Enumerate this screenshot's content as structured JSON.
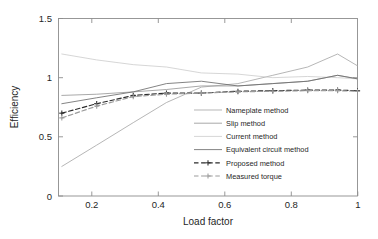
{
  "chart_data": {
    "type": "line",
    "title": "",
    "xlabel": "Load factor",
    "ylabel": "Efficiency",
    "xlim": [
      0.1,
      1.0
    ],
    "ylim": [
      0,
      1.5
    ],
    "xticks": [
      "0.2",
      "0.4",
      "0.6",
      "0.8",
      "1"
    ],
    "xtick_values": [
      0.2,
      0.4,
      0.6,
      0.8,
      1.0
    ],
    "yticks": [
      "0",
      "0.5",
      "1",
      "1.5"
    ],
    "ytick_values": [
      0,
      0.5,
      1.0,
      1.5
    ],
    "grid": false,
    "legend_position": "center-right-inside",
    "x": [
      0.11,
      0.215,
      0.325,
      0.425,
      0.53,
      0.64,
      0.745,
      0.85,
      0.94,
      1.0
    ],
    "series": [
      {
        "name": "Nameplate method",
        "color": "#a9a9a9",
        "style": "solid",
        "marker": "none",
        "values": [
          0.25,
          0.43,
          0.62,
          0.79,
          0.92,
          0.95,
          1.02,
          1.09,
          1.2,
          1.1
        ]
      },
      {
        "name": "Slip method",
        "color": "#9a9a9a",
        "style": "solid",
        "marker": "none",
        "values": [
          0.85,
          0.86,
          0.88,
          0.9,
          0.93,
          0.93,
          0.95,
          0.97,
          1.02,
          0.99
        ]
      },
      {
        "name": "Current method",
        "color": "#cfcfcf",
        "style": "solid",
        "marker": "none",
        "values": [
          1.2,
          1.15,
          1.11,
          1.09,
          1.04,
          1.03,
          1.0,
          1.01,
          1.0,
          0.99
        ]
      },
      {
        "name": "Equivalent circuit method",
        "color": "#6e6e6e",
        "style": "solid",
        "marker": "none",
        "values": [
          0.78,
          0.83,
          0.88,
          0.95,
          0.97,
          0.93,
          0.95,
          0.97,
          1.02,
          0.99
        ]
      },
      {
        "name": "Proposed method",
        "color": "#2b2b2b",
        "style": "dashed",
        "marker": "plus",
        "values": [
          0.7,
          0.78,
          0.85,
          0.87,
          0.87,
          0.885,
          0.89,
          0.895,
          0.895,
          0.89
        ]
      },
      {
        "name": "Measured torque",
        "color": "#9b9b9b",
        "style": "dashed",
        "marker": "plus",
        "values": [
          0.66,
          0.76,
          0.84,
          0.86,
          0.87,
          0.88,
          0.885,
          0.89,
          0.89,
          0.885
        ]
      }
    ]
  },
  "legend": {
    "entries": [
      {
        "label": "Nameplate method"
      },
      {
        "label": "Slip method"
      },
      {
        "label": "Current method"
      },
      {
        "label": "Equivalent circuit method"
      },
      {
        "label": "Proposed method"
      },
      {
        "label": "Measured torque"
      }
    ]
  }
}
